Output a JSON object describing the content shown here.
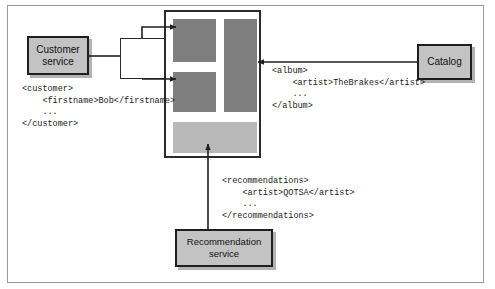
{
  "figure": {
    "frame": {
      "border_color": "#9a9a9a"
    }
  },
  "panel": {
    "name": "aggregating-application-panel",
    "border_color": "#2b2b2b",
    "blocks": [
      {
        "id": "top-left",
        "shade": "dark",
        "color": "#7f7f7f"
      },
      {
        "id": "mid-left",
        "shade": "dark",
        "color": "#7f7f7f"
      },
      {
        "id": "right-tall",
        "shade": "dark",
        "color": "#7f7f7f"
      },
      {
        "id": "bottom-wide",
        "shade": "light",
        "color": "#b9b9b9"
      }
    ]
  },
  "services": {
    "customer": {
      "line1": "Customer",
      "line2": "service",
      "fill": "#c3c3c3",
      "border": "#1f1f1f"
    },
    "catalog": {
      "line1": "Catalog",
      "line2": "",
      "fill": "#c3c3c3",
      "border": "#1f1f1f"
    },
    "recommendation": {
      "line1": "Recommendation",
      "line2": "service",
      "fill": "#c3c3c3",
      "border": "#1f1f1f"
    }
  },
  "code_snippets": {
    "customer": "<customer>\n    <firstname>Bob</firstname>\n    ...\n</customer>",
    "album": "<album>\n    <artist>TheBrakes</artist>\n    ...\n</album>",
    "recommendations": "<recommendations>\n    <artist>QOTSA</artist>\n    ...\n</recommendations>"
  },
  "connectors": [
    {
      "id": "customer-to-splitter",
      "from": "customer-service",
      "to": "splitter-box",
      "arrow": false
    },
    {
      "id": "splitter-to-block-top",
      "from": "splitter-box",
      "to": "panel-block-top-left",
      "arrow": true
    },
    {
      "id": "splitter-to-block-mid",
      "from": "splitter-box",
      "to": "panel-block-mid-left",
      "arrow": true
    },
    {
      "id": "catalog-to-block-right",
      "from": "catalog",
      "to": "panel-block-right-tall",
      "arrow": true
    },
    {
      "id": "recommendation-to-block",
      "from": "recommendation-service",
      "to": "panel-block-bottom-wide",
      "arrow": true
    }
  ]
}
